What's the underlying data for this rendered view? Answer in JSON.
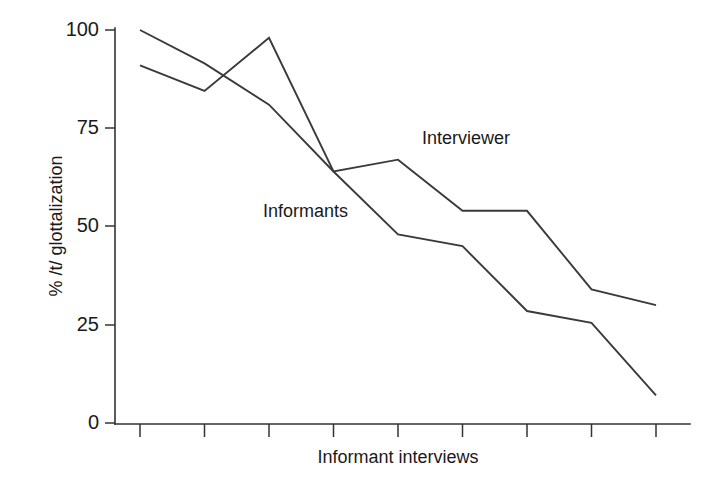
{
  "chart_data": {
    "type": "line",
    "title": "",
    "xlabel": "Informant interviews",
    "ylabel": "% /t/ glottalization",
    "ylim": [
      0,
      100
    ],
    "yticks": [
      0,
      25,
      50,
      75,
      100
    ],
    "ytick_labels": [
      "0",
      "25",
      "50",
      "75",
      "100"
    ],
    "xticks": [
      1,
      2,
      3,
      4,
      5,
      6,
      7,
      8,
      9
    ],
    "xtick_labels": [
      "",
      "",
      "",
      "",
      "",
      "",
      "",
      "",
      ""
    ],
    "grid": false,
    "legend_position": "inline-annotation",
    "x": [
      1,
      2,
      3,
      4,
      5,
      6,
      7,
      8,
      9
    ],
    "series": [
      {
        "name": "Interviewer",
        "values": [
          91,
          84.5,
          98,
          64,
          67,
          54,
          54,
          34,
          30
        ],
        "label_text": "Interviewer"
      },
      {
        "name": "Informants",
        "values": [
          100,
          91.5,
          81,
          64,
          48,
          45,
          28.5,
          25.5,
          7
        ],
        "label_text": "Informants"
      }
    ],
    "annotations": [
      {
        "text": "Interviewer",
        "x_px": 422,
        "y_px": 144
      },
      {
        "text": "Informants",
        "x_px": 263,
        "y_px": 217
      }
    ],
    "colors": {
      "line": "#3a3a3a",
      "axis": "#333333",
      "text": "#1a1a1a",
      "background": "#ffffff"
    }
  }
}
